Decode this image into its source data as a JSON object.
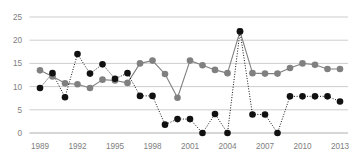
{
  "chart_data": {
    "type": "line",
    "title": "",
    "xlabel": "",
    "ylabel": "",
    "ylim": [
      0,
      25
    ],
    "yticks": [
      0,
      5,
      10,
      15,
      20,
      25
    ],
    "grid": true,
    "legend": "none",
    "x": [
      1989,
      1990,
      1991,
      1992,
      1993,
      1994,
      1995,
      1996,
      1997,
      1998,
      1999,
      2000,
      2001,
      2002,
      2003,
      2004,
      2005,
      2006,
      2007,
      2008,
      2009,
      2010,
      2011,
      2012,
      2013
    ],
    "xtick_labels": [
      "1989",
      "1992",
      "1995",
      "1998",
      "2001",
      "2004",
      "2007",
      "2010",
      "2013"
    ],
    "xticks": [
      1989,
      1992,
      1995,
      1998,
      2001,
      2004,
      2007,
      2010,
      2013
    ],
    "series": [
      {
        "name": "gray-series",
        "color": "#808080",
        "line_style": "solid",
        "marker": "circle",
        "values": [
          13.5,
          12.2,
          10.7,
          10.5,
          9.7,
          11.5,
          11.3,
          10.8,
          15.0,
          15.6,
          12.7,
          7.6,
          15.6,
          14.6,
          13.6,
          12.9,
          21.9,
          12.9,
          12.8,
          12.8,
          14.0,
          15.0,
          14.7,
          13.8,
          13.8
        ]
      },
      {
        "name": "black-series",
        "color": "#111111",
        "line_style": "dotted",
        "marker": "circle",
        "values": [
          9.7,
          12.9,
          7.7,
          17.0,
          12.8,
          14.8,
          11.7,
          12.9,
          8.0,
          8.0,
          1.8,
          3.0,
          3.0,
          0.0,
          4.1,
          0.0,
          21.9,
          4.0,
          4.0,
          0.0,
          7.9,
          7.9,
          7.9,
          7.9,
          6.8
        ]
      }
    ]
  },
  "axis_colors": {
    "grid": "#b8b8b8",
    "axis": "#9a9a9a",
    "tick_label": "#808080"
  }
}
